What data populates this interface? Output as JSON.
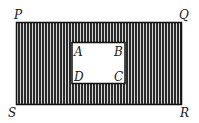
{
  "figure": {
    "outer_rectangle": {
      "vertices": [
        "P",
        "Q",
        "R",
        "S"
      ],
      "fill": "vertical-stripes",
      "stroke_color": "#111111",
      "stripe_dark": "#2a2a2a",
      "stripe_light": "#d8d8d8"
    },
    "inner_rectangle": {
      "vertices": [
        "A",
        "B",
        "C",
        "D"
      ],
      "fill": "#ffffff",
      "stroke_color": "#111111"
    },
    "labels": {
      "P": "P",
      "Q": "Q",
      "R": "R",
      "S": "S",
      "A": "A",
      "B": "B",
      "C": "C",
      "D": "D"
    }
  }
}
